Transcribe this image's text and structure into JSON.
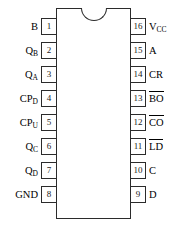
{
  "diagram": {
    "type": "ic-pinout",
    "package": "16-pin DIP",
    "notch": "semicircle-top-center",
    "pins": [
      {
        "number": "1",
        "side": "left",
        "name": "B",
        "subscript": "",
        "overline": false
      },
      {
        "number": "2",
        "side": "left",
        "name": "Q",
        "subscript": "B",
        "overline": false
      },
      {
        "number": "3",
        "side": "left",
        "name": "Q",
        "subscript": "A",
        "overline": false
      },
      {
        "number": "4",
        "side": "left",
        "name": "CP",
        "subscript": "D",
        "overline": false
      },
      {
        "number": "5",
        "side": "left",
        "name": "CP",
        "subscript": "U",
        "overline": false
      },
      {
        "number": "6",
        "side": "left",
        "name": "Q",
        "subscript": "C",
        "overline": false
      },
      {
        "number": "7",
        "side": "left",
        "name": "Q",
        "subscript": "D",
        "overline": false
      },
      {
        "number": "8",
        "side": "left",
        "name": "GND",
        "subscript": "",
        "overline": false
      },
      {
        "number": "9",
        "side": "right",
        "name": "D",
        "subscript": "",
        "overline": false
      },
      {
        "number": "10",
        "side": "right",
        "name": "C",
        "subscript": "",
        "overline": false
      },
      {
        "number": "11",
        "side": "right",
        "name": "LD",
        "subscript": "",
        "overline": true
      },
      {
        "number": "12",
        "side": "right",
        "name": "CO",
        "subscript": "",
        "overline": true
      },
      {
        "number": "13",
        "side": "right",
        "name": "BO",
        "subscript": "",
        "overline": true
      },
      {
        "number": "14",
        "side": "right",
        "name": "CR",
        "subscript": "",
        "overline": false
      },
      {
        "number": "15",
        "side": "right",
        "name": "A",
        "subscript": "",
        "overline": false
      },
      {
        "number": "16",
        "side": "right",
        "name": "V",
        "subscript": "CC",
        "overline": false
      }
    ],
    "colors": {
      "outline": "#2b2b2b",
      "body_fill": "#ffffff",
      "text": "#000000",
      "background": "#ffffff"
    }
  }
}
